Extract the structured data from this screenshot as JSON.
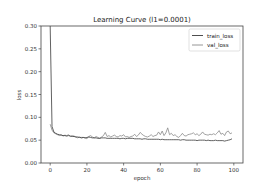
{
  "chart_data": {
    "type": "line",
    "title": "Learning Curve (l1=0.0001)",
    "xlabel": "epoch",
    "ylabel": "loss",
    "xlim": [
      -5,
      105
    ],
    "ylim": [
      0.0,
      0.3
    ],
    "xticks": [
      0,
      20,
      40,
      60,
      80,
      100
    ],
    "yticks": [
      0.0,
      0.05,
      0.1,
      0.15,
      0.2,
      0.25,
      0.3
    ],
    "ytick_labels": [
      "0.00",
      "0.05",
      "0.10",
      "0.15",
      "0.20",
      "0.25",
      "0.30"
    ],
    "xtick_labels": [
      "0",
      "20",
      "40",
      "60",
      "80",
      "100"
    ],
    "grid": false,
    "legend_position": "upper right",
    "series": [
      {
        "name": "train_loss",
        "color": "#3a3a3a",
        "x": [
          0,
          1,
          2,
          3,
          4,
          5,
          6,
          7,
          8,
          9,
          10,
          11,
          12,
          13,
          14,
          15,
          16,
          17,
          18,
          19,
          20,
          21,
          22,
          23,
          24,
          25,
          26,
          27,
          28,
          29,
          30,
          31,
          32,
          33,
          34,
          35,
          36,
          37,
          38,
          39,
          40,
          41,
          42,
          43,
          44,
          45,
          46,
          47,
          48,
          49,
          50,
          51,
          52,
          53,
          54,
          55,
          56,
          57,
          58,
          59,
          60,
          61,
          62,
          63,
          64,
          65,
          66,
          67,
          68,
          69,
          70,
          71,
          72,
          73,
          74,
          75,
          76,
          77,
          78,
          79,
          80,
          81,
          82,
          83,
          84,
          85,
          86,
          87,
          88,
          89,
          90,
          91,
          92,
          93,
          94,
          95,
          96,
          97,
          98,
          99
        ],
        "values": [
          0.3,
          0.08,
          0.068,
          0.065,
          0.063,
          0.062,
          0.061,
          0.06,
          0.06,
          0.059,
          0.06,
          0.059,
          0.058,
          0.058,
          0.057,
          0.057,
          0.056,
          0.056,
          0.056,
          0.055,
          0.056,
          0.057,
          0.056,
          0.055,
          0.055,
          0.055,
          0.054,
          0.054,
          0.055,
          0.055,
          0.055,
          0.054,
          0.054,
          0.054,
          0.054,
          0.054,
          0.054,
          0.054,
          0.053,
          0.054,
          0.054,
          0.053,
          0.054,
          0.054,
          0.054,
          0.054,
          0.053,
          0.053,
          0.053,
          0.053,
          0.052,
          0.053,
          0.053,
          0.052,
          0.052,
          0.052,
          0.052,
          0.052,
          0.052,
          0.052,
          0.051,
          0.052,
          0.051,
          0.051,
          0.051,
          0.051,
          0.051,
          0.051,
          0.051,
          0.051,
          0.051,
          0.05,
          0.051,
          0.051,
          0.05,
          0.05,
          0.05,
          0.05,
          0.05,
          0.05,
          0.049,
          0.05,
          0.05,
          0.05,
          0.05,
          0.049,
          0.05,
          0.049,
          0.049,
          0.049,
          0.05,
          0.049,
          0.049,
          0.049,
          0.049,
          0.048,
          0.049,
          0.05,
          0.051,
          0.053
        ]
      },
      {
        "name": "val_loss",
        "color": "#8a8a8a",
        "x": [
          0,
          1,
          2,
          3,
          4,
          5,
          6,
          7,
          8,
          9,
          10,
          11,
          12,
          13,
          14,
          15,
          16,
          17,
          18,
          19,
          20,
          21,
          22,
          23,
          24,
          25,
          26,
          27,
          28,
          29,
          30,
          31,
          32,
          33,
          34,
          35,
          36,
          37,
          38,
          39,
          40,
          41,
          42,
          43,
          44,
          45,
          46,
          47,
          48,
          49,
          50,
          51,
          52,
          53,
          54,
          55,
          56,
          57,
          58,
          59,
          60,
          61,
          62,
          63,
          64,
          65,
          66,
          67,
          68,
          69,
          70,
          71,
          72,
          73,
          74,
          75,
          76,
          77,
          78,
          79,
          80,
          81,
          82,
          83,
          84,
          85,
          86,
          87,
          88,
          89,
          90,
          91,
          92,
          93,
          94,
          95,
          96,
          97,
          98,
          99
        ],
        "values": [
          0.085,
          0.072,
          0.066,
          0.064,
          0.062,
          0.06,
          0.062,
          0.059,
          0.061,
          0.06,
          0.062,
          0.058,
          0.06,
          0.059,
          0.057,
          0.055,
          0.057,
          0.054,
          0.056,
          0.055,
          0.053,
          0.058,
          0.06,
          0.057,
          0.055,
          0.058,
          0.056,
          0.054,
          0.057,
          0.06,
          0.067,
          0.058,
          0.06,
          0.057,
          0.059,
          0.061,
          0.058,
          0.057,
          0.06,
          0.059,
          0.062,
          0.057,
          0.058,
          0.056,
          0.058,
          0.059,
          0.063,
          0.058,
          0.061,
          0.067,
          0.063,
          0.06,
          0.058,
          0.057,
          0.059,
          0.062,
          0.058,
          0.06,
          0.061,
          0.068,
          0.062,
          0.07,
          0.06,
          0.066,
          0.077,
          0.062,
          0.065,
          0.06,
          0.062,
          0.058,
          0.056,
          0.06,
          0.065,
          0.06,
          0.059,
          0.062,
          0.063,
          0.064,
          0.066,
          0.062,
          0.064,
          0.06,
          0.063,
          0.068,
          0.063,
          0.062,
          0.061,
          0.063,
          0.062,
          0.064,
          0.062,
          0.066,
          0.071,
          0.063,
          0.065,
          0.06,
          0.068,
          0.07,
          0.064,
          0.066
        ]
      }
    ]
  }
}
